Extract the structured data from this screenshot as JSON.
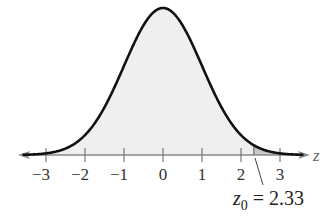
{
  "chart_data": {
    "type": "area",
    "title": "",
    "xlabel": "z",
    "ylabel": "",
    "xlim": [
      -3.5,
      3.5
    ],
    "x_ticks": [
      -3,
      -2,
      -1,
      0,
      1,
      2,
      3
    ],
    "x_tick_labels": [
      "−3",
      "−2",
      "−1",
      "0",
      "1",
      "2",
      "3"
    ],
    "grid": false,
    "legend": null,
    "distribution": {
      "name": "standard normal",
      "mean": 0,
      "sd": 1
    },
    "shaded_regions": [
      {
        "from": -3.5,
        "to": 2.33,
        "color": "#efefef",
        "label": "body"
      },
      {
        "from": 2.33,
        "to": 3.5,
        "color": "#c8c8c8",
        "label": "right tail"
      }
    ],
    "annotations": [
      {
        "text_var": "z",
        "text_sub": "0",
        "text_rest": " = 2.33",
        "x": 2.33
      }
    ]
  },
  "axis": {
    "name": "z",
    "ticks": [
      {
        "value": -3,
        "label": "−3"
      },
      {
        "value": -2,
        "label": "−2"
      },
      {
        "value": -1,
        "label": "−1"
      },
      {
        "value": 0,
        "label": "0"
      },
      {
        "value": 1,
        "label": "1"
      },
      {
        "value": 2,
        "label": "2"
      },
      {
        "value": 3,
        "label": "3"
      }
    ]
  },
  "annotation": {
    "var": "z",
    "sub": "0",
    "rest": " = 2.33"
  },
  "colors": {
    "curve": "#111111",
    "axis": "#888888",
    "body_fill": "#efefef",
    "tail_fill": "#c8c8c8"
  }
}
